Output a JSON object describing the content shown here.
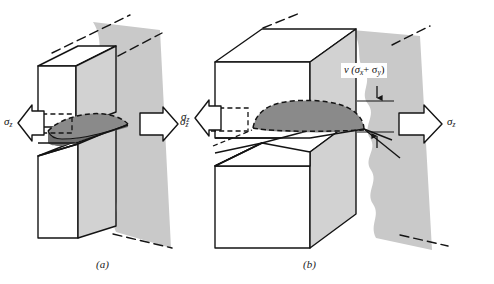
{
  "figure": {
    "background_color": "#ffffff",
    "line_color": "#1a1a1a",
    "fracture_surface_color": "#c9c9c9",
    "plastic_zone_color": "#8a8a8a",
    "side_face_color": "#d0d0d0",
    "panels": [
      {
        "id": "a",
        "caption": "(a)",
        "description": "Thin plate, plane stress, through-thickness lens shaped plastic zone",
        "stress_label_left": "σ",
        "stress_label_left_sub": "z",
        "stress_label_right": "σ",
        "stress_label_right_sub": "z"
      },
      {
        "id": "b",
        "caption": "(b)",
        "description": "Thick plate, plane strain, dome shaped plastic zone with contraction dimension",
        "stress_label_left": "σ",
        "stress_label_left_sub": "z",
        "stress_label_right": "σ",
        "stress_label_right_sub": "z",
        "dimension_label": "ν (σ",
        "dimension_label_sub1": "x",
        "dimension_label_mid": "+ σ",
        "dimension_label_sub2": "y",
        "dimension_label_end": ")"
      }
    ]
  }
}
